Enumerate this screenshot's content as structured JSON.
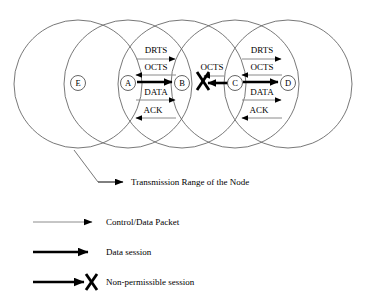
{
  "figure": {
    "background": "#ffffff",
    "stroke": "#4d4d4d",
    "ink": "#000000"
  },
  "topology": {
    "ranges": [
      {
        "node": "E",
        "cx": 78,
        "cy": 84,
        "r": 64
      },
      {
        "node": "A",
        "cx": 128,
        "cy": 84,
        "r": 64
      },
      {
        "node": "B",
        "cx": 182,
        "cy": 84,
        "r": 64
      },
      {
        "node": "C",
        "cx": 235,
        "cy": 84,
        "r": 64
      },
      {
        "node": "D",
        "cx": 288,
        "cy": 84,
        "r": 64
      }
    ],
    "nodes": [
      {
        "label": "E",
        "cx": 78,
        "cy": 84
      },
      {
        "label": "A",
        "cx": 128,
        "cy": 84
      },
      {
        "label": "B",
        "cx": 182,
        "cy": 84
      },
      {
        "label": "C",
        "cx": 235,
        "cy": 84
      },
      {
        "label": "D",
        "cx": 288,
        "cy": 84
      }
    ]
  },
  "sessions": {
    "left": {
      "from": "A",
      "to": "B",
      "packets": [
        {
          "label": "DRTS",
          "direction": "right"
        },
        {
          "label": "OCTS",
          "direction": "left"
        },
        {
          "label": "DATA",
          "direction": "right"
        },
        {
          "label": "ACK",
          "direction": "left"
        }
      ],
      "data_session_direction": "right"
    },
    "right": {
      "from": "C",
      "to": "D",
      "packets": [
        {
          "label": "DRTS",
          "direction": "right"
        },
        {
          "label": "OCTS",
          "direction": "left"
        },
        {
          "label": "DATA",
          "direction": "right"
        },
        {
          "label": "ACK",
          "direction": "left"
        }
      ],
      "data_session_direction": "right"
    },
    "blocked": {
      "label": "OCTS",
      "from": "C",
      "toward": "B",
      "direction": "left",
      "blocked": true
    }
  },
  "callout": {
    "text": "Transmission Range of the Node"
  },
  "legend": {
    "items": [
      {
        "label": "Control/Data Packet",
        "style": "thin-arrow"
      },
      {
        "label": "Data session",
        "style": "thick-arrow"
      },
      {
        "label": "Non-permissible session",
        "style": "thick-arrow-blocked"
      }
    ]
  }
}
